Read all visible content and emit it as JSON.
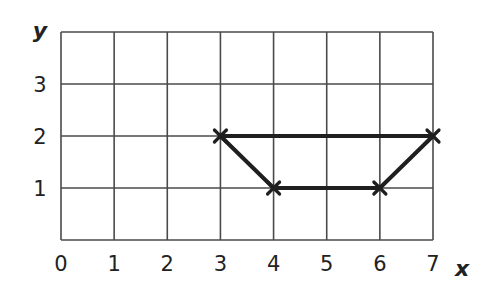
{
  "chart_data": {
    "type": "line",
    "title": "",
    "xlabel": "x",
    "ylabel": "y",
    "xlim": [
      0,
      7
    ],
    "ylim": [
      0,
      4
    ],
    "x_ticks": [
      "0",
      "1",
      "2",
      "3",
      "4",
      "5",
      "6",
      "7"
    ],
    "y_ticks": [
      "1",
      "2",
      "3"
    ],
    "grid": true,
    "legend": null,
    "series": [
      {
        "name": "shape",
        "closed": true,
        "marker": "x",
        "points": [
          {
            "x": 3,
            "y": 2
          },
          {
            "x": 4,
            "y": 1
          },
          {
            "x": 6,
            "y": 1
          },
          {
            "x": 7,
            "y": 2
          }
        ]
      }
    ],
    "colors": {
      "grid": "#4a4a4a",
      "line": "#1f1f1f",
      "text": "#222222"
    }
  }
}
